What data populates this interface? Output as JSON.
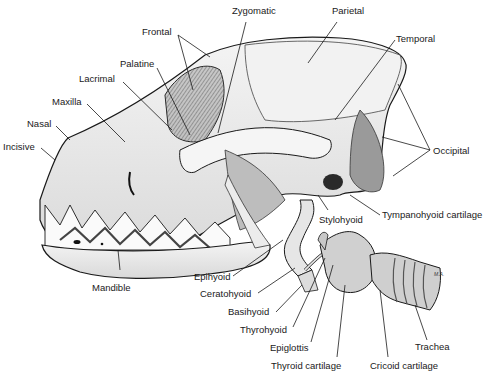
{
  "diagram": {
    "labels": {
      "frontal": "Frontal",
      "zygomatic": "Zygomatic",
      "parietal": "Parietal",
      "palatine": "Palatine",
      "temporal": "Temporal",
      "lacrimal": "Lacrimal",
      "maxilla": "Maxilla",
      "nasal": "Nasal",
      "incisive": "Incisive",
      "occipital": "Occipital",
      "stylohyoid": "Stylohyoid",
      "tympanohyoid": "Tympanohyoid cartilage",
      "mandible": "Mandible",
      "epihyoid": "Epihyoid",
      "ceratohyoid": "Ceratohyoid",
      "basihyoid": "Basihyoid",
      "thyrohyoid": "Thyrohyoid",
      "epiglottis": "Epiglottis",
      "thyroid_cartilage": "Thyroid cartilage",
      "cricoid_cartilage": "Cricoid cartilage",
      "trachea": "Trachea"
    },
    "signature": "M.A.",
    "colors": {
      "bone": "#ededed",
      "shadow": "#8a8a8a",
      "line": "#1a1a1a",
      "background": "#ffffff"
    }
  }
}
